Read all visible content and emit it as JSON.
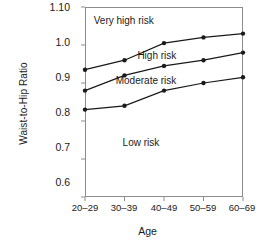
{
  "chart_data": {
    "type": "line",
    "title": "",
    "xlabel": "Age",
    "ylabel": "Waist-to-Hip Ratio",
    "categories": [
      "20–29",
      "30–39",
      "40–49",
      "50–59",
      "60–69"
    ],
    "ytick_labels": [
      "1.10",
      "1.0",
      "0.9",
      "0.8",
      "0.7",
      "0.6"
    ],
    "ytick_values": [
      1.1,
      1.0,
      0.9,
      0.8,
      0.7,
      0.6
    ],
    "ylim": [
      0.6,
      1.1
    ],
    "grid": false,
    "legend": "none",
    "marker": "filled-circle",
    "line_color": "#1a1a1a",
    "series": [
      {
        "name": "very-high-risk-boundary",
        "values": [
          0.935,
          0.96,
          1.005,
          1.02,
          1.03
        ]
      },
      {
        "name": "high-risk-boundary",
        "values": [
          0.88,
          0.92,
          0.945,
          0.96,
          0.98
        ]
      },
      {
        "name": "moderate-risk-boundary",
        "values": [
          0.83,
          0.84,
          0.88,
          0.9,
          0.915
        ]
      }
    ],
    "annotations": [
      {
        "text": "Very high risk",
        "x": 0.98,
        "y": 1.063
      },
      {
        "text": "High risk",
        "x": 1.82,
        "y": 0.972
      },
      {
        "text": "Moderate risk",
        "x": 1.55,
        "y": 0.905
      },
      {
        "text": "Low risk",
        "x": 1.42,
        "y": 0.742
      }
    ]
  },
  "axis": {
    "x_title": "Age",
    "y_title": "Waist-to-Hip Ratio"
  }
}
